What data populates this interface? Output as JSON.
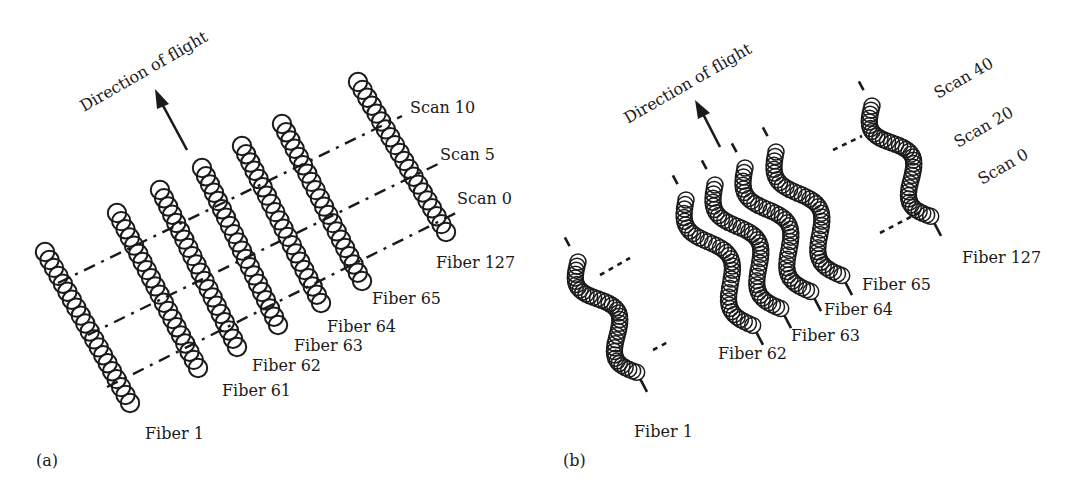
{
  "figure": {
    "panel_a": {
      "label": "(a)",
      "direction_label": "Direction of flight",
      "scan_labels": [
        "Scan 10",
        "Scan 5",
        "Scan 0"
      ],
      "fiber_labels": [
        "Fiber 1",
        "Fiber 61",
        "Fiber 62",
        "Fiber 63",
        "Fiber 64",
        "Fiber 65",
        "Fiber 127"
      ]
    },
    "panel_b": {
      "label": "(b)",
      "direction_label": "Direction of flight",
      "scan_labels": [
        "Scan 40",
        "Scan 20",
        "Scan 0"
      ],
      "fiber_labels": [
        "Fiber 1",
        "Fiber 62",
        "Fiber 63",
        "Fiber 64",
        "Fiber 65",
        "Fiber 127"
      ]
    },
    "colors": {
      "ink": "#1a1a1a",
      "background": "#ffffff"
    }
  }
}
